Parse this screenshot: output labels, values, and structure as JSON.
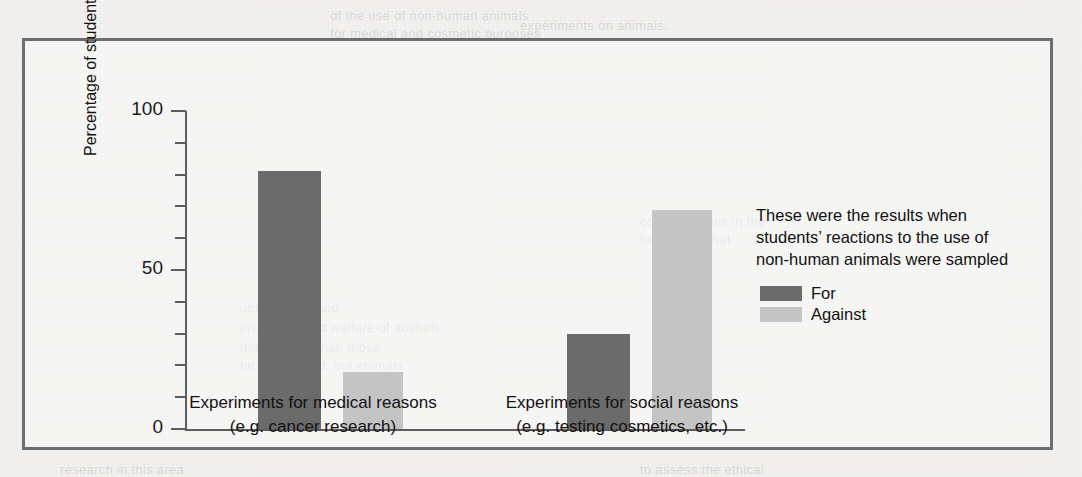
{
  "figure": {
    "frame_color": "#6d6d6d",
    "page_background": "#f2f1ef"
  },
  "chart_data": {
    "type": "bar",
    "title": "",
    "subtitle": "",
    "xlabel": "",
    "ylabel": "Percentage of students",
    "ylim": [
      0,
      100
    ],
    "y_tick_step": 10,
    "y_labeled_ticks": [
      "0",
      "50",
      "100"
    ],
    "grid": false,
    "legend_position": "right",
    "categories": [
      "Experiments for medical reasons\n(e.g. cancer research)",
      "Experiments for social reasons\n(e.g. testing cosmetics, etc.)"
    ],
    "category_lines": [
      [
        "Experiments for medical reasons",
        "(e.g. cancer research)"
      ],
      [
        "Experiments for social reasons",
        "(e.g. testing cosmetics, etc.)"
      ]
    ],
    "series": [
      {
        "name": "For",
        "color": "#6b6b6b",
        "values": [
          81,
          30
        ]
      },
      {
        "name": "Against",
        "color": "#c4c4c4",
        "values": [
          18,
          69
        ]
      }
    ]
  },
  "y_axis": {
    "ticks": [
      {
        "value": 100,
        "label": "100",
        "major": true
      },
      {
        "value": 90,
        "label": "",
        "major": false
      },
      {
        "value": 80,
        "label": "",
        "major": false
      },
      {
        "value": 70,
        "label": "",
        "major": false
      },
      {
        "value": 60,
        "label": "",
        "major": false
      },
      {
        "value": 50,
        "label": "50",
        "major": true
      },
      {
        "value": 40,
        "label": "",
        "major": false
      },
      {
        "value": 30,
        "label": "",
        "major": false
      },
      {
        "value": 20,
        "label": "",
        "major": false
      },
      {
        "value": 10,
        "label": "",
        "major": false
      },
      {
        "value": 0,
        "label": "0",
        "major": true
      }
    ],
    "title": "Percentage of students"
  },
  "legend": {
    "caption_lines": [
      "These were the results when",
      "students’ reactions to the use of",
      "non-human animals were sampled"
    ],
    "items": [
      {
        "label": "For",
        "color": "#6b6b6b"
      },
      {
        "label": "Against",
        "color": "#c4c4c4"
      }
    ]
  },
  "bleed_through": {
    "lines": [
      {
        "text": "of the use of non-human animals",
        "x": 330,
        "y": 8
      },
      {
        "text": "for medical and cosmetic purposes",
        "x": 330,
        "y": 26
      },
      {
        "text": "experiments on animals.",
        "x": 520,
        "y": 18
      },
      {
        "text": "considerations in the",
        "x": 640,
        "y": 214
      },
      {
        "text": "to the idea that",
        "x": 640,
        "y": 232
      },
      {
        "text": "one species and",
        "x": 240,
        "y": 300
      },
      {
        "text": "protection and welfare of animals",
        "x": 240,
        "y": 320
      },
      {
        "text": "these rather than those",
        "x": 240,
        "y": 340
      },
      {
        "text": "be considered, but animals",
        "x": 240,
        "y": 358
      },
      {
        "text": "research in this area",
        "x": 60,
        "y": 462
      },
      {
        "text": "to assess the ethical",
        "x": 640,
        "y": 462
      }
    ]
  }
}
